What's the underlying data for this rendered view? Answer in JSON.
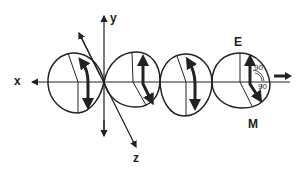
{
  "diagram": {
    "type": "electromagnetic-wave",
    "axes": {
      "x_label": "x",
      "y_label": "y",
      "z_label": "z"
    },
    "field_labels": {
      "electric": "E",
      "magnetic": "M"
    },
    "angles": {
      "top": "90",
      "bottom": "90"
    },
    "lobes": 4,
    "colors": {
      "stroke": "#222222",
      "background": "#ffffff"
    }
  }
}
